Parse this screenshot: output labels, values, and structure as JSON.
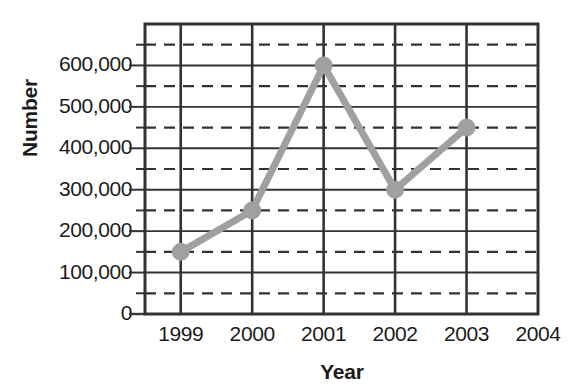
{
  "chart_data": {
    "type": "line",
    "title": "",
    "xlabel": "Year",
    "ylabel": "Number",
    "categories": [
      "1999",
      "2000",
      "2001",
      "2002",
      "2003"
    ],
    "x": [
      1999,
      2000,
      2001,
      2002,
      2003
    ],
    "values": [
      150000,
      250000,
      600000,
      300000,
      450000
    ],
    "series": [
      {
        "name": "Number",
        "values": [
          150000,
          250000,
          600000,
          300000,
          450000
        ],
        "color": "#a0a0a0",
        "marker": "circle"
      }
    ],
    "xlim": [
      1998.5,
      2004
    ],
    "ylim": [
      0,
      700000
    ],
    "x_tick_labels": [
      "1999",
      "2000",
      "2001",
      "2002",
      "2003",
      "2004"
    ],
    "x_tick_values": [
      1999,
      2000,
      2001,
      2002,
      2003,
      2004
    ],
    "y_tick_labels": [
      "0",
      "100,000",
      "200,000",
      "300,000",
      "400,000",
      "500,000",
      "600,000"
    ],
    "y_tick_values": [
      0,
      100000,
      200000,
      300000,
      400000,
      500000,
      600000
    ],
    "y_minor_gridline_values": [
      50000,
      150000,
      250000,
      350000,
      450000,
      550000,
      650000
    ],
    "grid": {
      "major_horizontal": "solid",
      "minor_horizontal": "dashed",
      "vertical": "solid",
      "color": "#333333"
    },
    "legend": "none",
    "legend_position": "none",
    "annotations": [],
    "colors": {
      "line": "#a0a0a0",
      "marker": "#a0a0a0",
      "axis": "#1b1b1b",
      "grid": "#333333",
      "background": "#ffffff",
      "text": "#1b1b1b"
    }
  }
}
